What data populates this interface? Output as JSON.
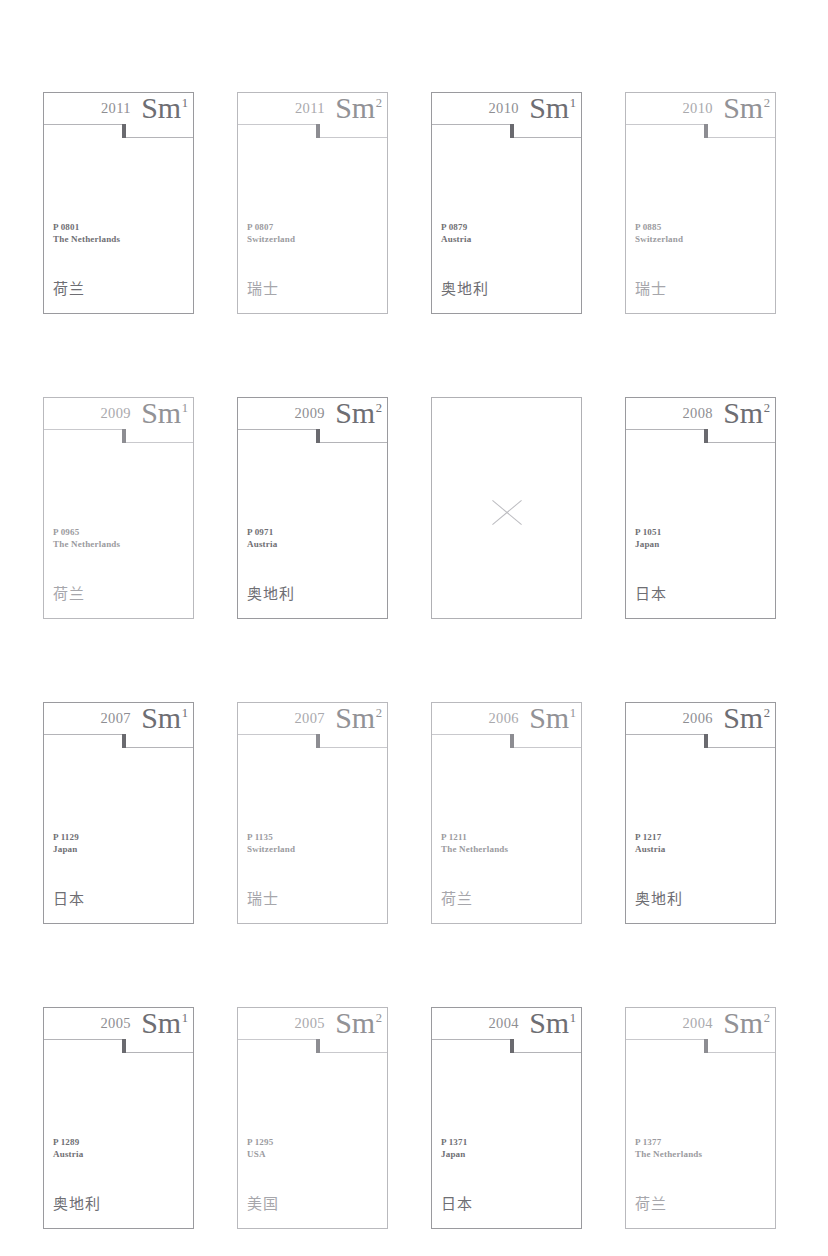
{
  "page": {
    "background_color": "#ffffff",
    "border_color": "#9a9a9e",
    "text_color": "#6f6f74",
    "faint_text_color": "#9b9ba0",
    "tick_color": "#6a6a6f",
    "columns": 4,
    "rows": 4
  },
  "cards": [
    {
      "index": 0,
      "year": "2011",
      "mark": "Sm",
      "superscript": "1",
      "code": "P 0801",
      "country": "The Netherlands",
      "country_cn": "荷兰",
      "empty": false,
      "faded": false
    },
    {
      "index": 1,
      "year": "2011",
      "mark": "Sm",
      "superscript": "2",
      "code": "P 0807",
      "country": "Switzerland",
      "country_cn": "瑞士",
      "empty": false,
      "faded": true
    },
    {
      "index": 2,
      "year": "2010",
      "mark": "Sm",
      "superscript": "1",
      "code": "P 0879",
      "country": "Austria",
      "country_cn": "奥地利",
      "empty": false,
      "faded": false
    },
    {
      "index": 3,
      "year": "2010",
      "mark": "Sm",
      "superscript": "2",
      "code": "P 0885",
      "country": "Switzerland",
      "country_cn": "瑞士",
      "empty": false,
      "faded": true
    },
    {
      "index": 4,
      "year": "2009",
      "mark": "Sm",
      "superscript": "1",
      "code": "P 0965",
      "country": "The Netherlands",
      "country_cn": "荷兰",
      "empty": false,
      "faded": true
    },
    {
      "index": 5,
      "year": "2009",
      "mark": "Sm",
      "superscript": "2",
      "code": "P 0971",
      "country": "Austria",
      "country_cn": "奥地利",
      "empty": false,
      "faded": false
    },
    {
      "index": 6,
      "year": "",
      "mark": "",
      "superscript": "",
      "code": "",
      "country": "",
      "country_cn": "",
      "empty": true,
      "faded": true
    },
    {
      "index": 7,
      "year": "2008",
      "mark": "Sm",
      "superscript": "2",
      "code": "P 1051",
      "country": "Japan",
      "country_cn": "日本",
      "empty": false,
      "faded": false
    },
    {
      "index": 8,
      "year": "2007",
      "mark": "Sm",
      "superscript": "1",
      "code": "P 1129",
      "country": "Japan",
      "country_cn": "日本",
      "empty": false,
      "faded": false
    },
    {
      "index": 9,
      "year": "2007",
      "mark": "Sm",
      "superscript": "2",
      "code": "P 1135",
      "country": "Switzerland",
      "country_cn": "瑞士",
      "empty": false,
      "faded": true
    },
    {
      "index": 10,
      "year": "2006",
      "mark": "Sm",
      "superscript": "1",
      "code": "P 1211",
      "country": "The Netherlands",
      "country_cn": "荷兰",
      "empty": false,
      "faded": true
    },
    {
      "index": 11,
      "year": "2006",
      "mark": "Sm",
      "superscript": "2",
      "code": "P 1217",
      "country": "Austria",
      "country_cn": "奥地利",
      "empty": false,
      "faded": false
    },
    {
      "index": 12,
      "year": "2005",
      "mark": "Sm",
      "superscript": "1",
      "code": "P 1289",
      "country": "Austria",
      "country_cn": "奥地利",
      "empty": false,
      "faded": false
    },
    {
      "index": 13,
      "year": "2005",
      "mark": "Sm",
      "superscript": "2",
      "code": "P 1295",
      "country": "USA",
      "country_cn": "美国",
      "empty": false,
      "faded": true
    },
    {
      "index": 14,
      "year": "2004",
      "mark": "Sm",
      "superscript": "1",
      "code": "P 1371",
      "country": "Japan",
      "country_cn": "日本",
      "empty": false,
      "faded": false
    },
    {
      "index": 15,
      "year": "2004",
      "mark": "Sm",
      "superscript": "2",
      "code": "P 1377",
      "country": "The Netherlands",
      "country_cn": "荷兰",
      "empty": false,
      "faded": true
    }
  ]
}
